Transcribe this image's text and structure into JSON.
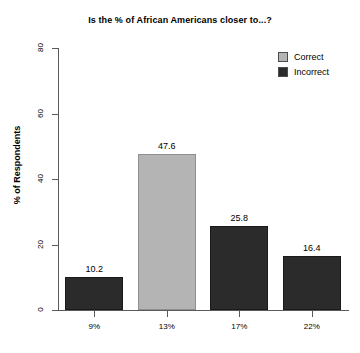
{
  "chart_data": {
    "type": "bar",
    "title": "Is the % of African Americans closer to...?",
    "xlabel": "",
    "ylabel": "% of Respondents",
    "categories": [
      "9%",
      "13%",
      "17%",
      "22%"
    ],
    "values": [
      10.2,
      47.6,
      25.8,
      16.4
    ],
    "value_labels": [
      "10.2",
      "47.6",
      "25.8",
      "16.4"
    ],
    "bar_groups": [
      "Incorrect",
      "Correct",
      "Incorrect",
      "Incorrect"
    ],
    "ylim": [
      0,
      80
    ],
    "yticks": [
      0,
      20,
      40,
      60,
      80
    ],
    "ytick_labels": [
      "0",
      "20",
      "40",
      "60",
      "80"
    ],
    "grid": false,
    "legend_position": "top-right",
    "legend": [
      {
        "label": "Correct",
        "color": "#b4b4b4"
      },
      {
        "label": "Incorrect",
        "color": "#2b2b2b"
      }
    ],
    "colors": {
      "correct": "#b4b4b4",
      "incorrect": "#2b2b2b",
      "axis": "#5a5a5a",
      "background": "#ffffff",
      "text": "#000000"
    }
  }
}
